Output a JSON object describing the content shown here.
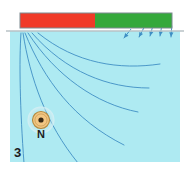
{
  "figure": {
    "number_label": "3",
    "compass_label": "N",
    "background_color": "#ffffff",
    "field_region": {
      "name": "magnetic-field-region",
      "fill_color": "#aeeaf2",
      "x": 10,
      "y": 31,
      "width": 170,
      "height": 131
    },
    "surface_line": {
      "name": "surface-line",
      "color": "#b9c2c6",
      "x1": 6,
      "x2": 184,
      "y": 31
    },
    "magnet": {
      "name": "bar-magnet",
      "x": 20,
      "y": 13,
      "width": 152,
      "height": 15,
      "border_color": "#7d8a90",
      "poles": [
        {
          "name": "magnet-pole-red",
          "color": "#f03a28",
          "x": 20,
          "width": 75
        },
        {
          "name": "magnet-pole-green",
          "color": "#35a83b",
          "x": 95,
          "width": 77
        }
      ]
    },
    "field_lines": {
      "name": "field-lines",
      "color": "#3f8fc4",
      "stroke_width": 0.9,
      "count": 6,
      "origin_x": 20,
      "origin_y": 32,
      "paths": [
        "M 21,33 C 19,60 20,110 24,163",
        "M 23,33 C 30,78 46,124 78,163",
        "M 25,33 C 44,80 74,120 124,145",
        "M 28,33 C 56,76 96,104 138,112",
        "M 32,33 C 66,72 108,88 149,88",
        "M 38,33 C 76,64 120,70 160,64"
      ],
      "arrow_tips": [
        {
          "x": 124,
          "y": 38,
          "angle": -52
        },
        {
          "x": 139,
          "y": 37,
          "angle": -62
        },
        {
          "x": 150,
          "y": 36,
          "angle": -74
        },
        {
          "x": 160,
          "y": 36,
          "angle": -80
        },
        {
          "x": 171,
          "y": 37,
          "angle": -86
        }
      ]
    },
    "compass": {
      "name": "compass-marker",
      "cx": 41,
      "cy": 120,
      "outer_radius": 8.5,
      "inner_radius": 2.6,
      "fill_color": "#f2c683",
      "edge_color": "#b4893f",
      "dot_color": "#3a2a16",
      "halo_color": "#cfe8ee",
      "label": "N",
      "label_x": 41,
      "label_y": 138,
      "label_color": "#1d1d1d",
      "label_size": 11
    },
    "number": {
      "name": "figure-number",
      "text": "3",
      "x": 14,
      "y": 157,
      "color": "#1d1d1d",
      "size": 13
    }
  }
}
